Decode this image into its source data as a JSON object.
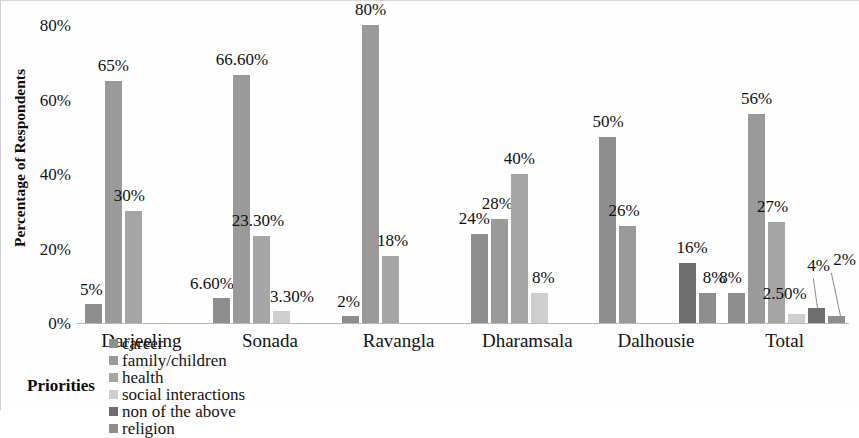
{
  "chart_data": {
    "type": "bar",
    "title": "",
    "xlabel": "",
    "ylabel": "Percentage of Respondents",
    "ylim": [
      0,
      80
    ],
    "y_ticks": [
      "0%",
      "20%",
      "40%",
      "60%",
      "80%"
    ],
    "y_tick_values": [
      0,
      20,
      40,
      60,
      80
    ],
    "grid": false,
    "legend_position": "bottom",
    "legend_title": "Priorities",
    "categories": [
      "Darjeeling",
      "Sonada",
      "Ravangla",
      "Dharamsala",
      "Dalhousie",
      "Total"
    ],
    "series": [
      {
        "name": "career",
        "color": "#8e8e8e",
        "values": [
          5,
          6.6,
          2,
          24,
          50,
          8
        ],
        "labels": [
          "5%",
          "6.60%",
          "2%",
          "24%",
          "50%",
          "8%"
        ]
      },
      {
        "name": "family/children",
        "color": "#9a9a9a",
        "values": [
          65,
          66.6,
          80,
          28,
          26,
          56
        ],
        "labels": [
          "65%",
          "66.60%",
          "80%",
          "28%",
          "26%",
          "56%"
        ]
      },
      {
        "name": "health",
        "color": "#a5a5a5",
        "values": [
          30,
          23.3,
          18,
          40,
          null,
          27
        ],
        "labels": [
          "30%",
          "23.30%",
          "18%",
          "40%",
          "",
          "27%"
        ]
      },
      {
        "name": "social interactions",
        "color": "#cfcfcf",
        "values": [
          null,
          3.3,
          null,
          8,
          null,
          2.5
        ],
        "labels": [
          "",
          "3.30%",
          "",
          "8%",
          "",
          "2.50%"
        ]
      },
      {
        "name": "non of the above",
        "color": "#6e6e6e",
        "values": [
          null,
          null,
          null,
          null,
          16,
          4
        ],
        "labels": [
          "",
          "",
          "",
          "",
          "16%",
          "4%"
        ]
      },
      {
        "name": "religion",
        "color": "#8e8e8e",
        "values": [
          null,
          null,
          null,
          null,
          8,
          2
        ],
        "labels": [
          "",
          "",
          "",
          "",
          "8%",
          "2%"
        ]
      }
    ]
  },
  "axis": {
    "y_title": "Percentage of Respondents",
    "y_ticks": [
      "80%",
      "60%",
      "40%",
      "20%",
      "0%"
    ],
    "x_categories": [
      "Darjeeling",
      "Sonada",
      "Ravangla",
      "Dharamsala",
      "Dalhousie",
      "Total"
    ]
  },
  "legend": {
    "title": "Priorities",
    "items": [
      {
        "label": "career",
        "color": "#8e8e8e"
      },
      {
        "label": "family/children",
        "color": "#9a9a9a"
      },
      {
        "label": "health",
        "color": "#a5a5a5"
      },
      {
        "label": "social interactions",
        "color": "#cfcfcf"
      },
      {
        "label": "non of the above",
        "color": "#6e6e6e"
      },
      {
        "label": "religion",
        "color": "#8e8e8e"
      }
    ]
  },
  "data_labels": {
    "darjeeling": [
      "5%",
      "65%",
      "30%"
    ],
    "sonada": [
      "6.60%",
      "66.60%",
      "23.30%",
      "3.30%"
    ],
    "ravangla": [
      "2%",
      "80%",
      "18%"
    ],
    "dharamsala": [
      "24%",
      "28%",
      "40%",
      "8%"
    ],
    "dalhousie": [
      "50%",
      "26%",
      "16%",
      "8%"
    ],
    "total": [
      "8%",
      "56%",
      "27%",
      "2.50%",
      "4%",
      "2%"
    ]
  }
}
